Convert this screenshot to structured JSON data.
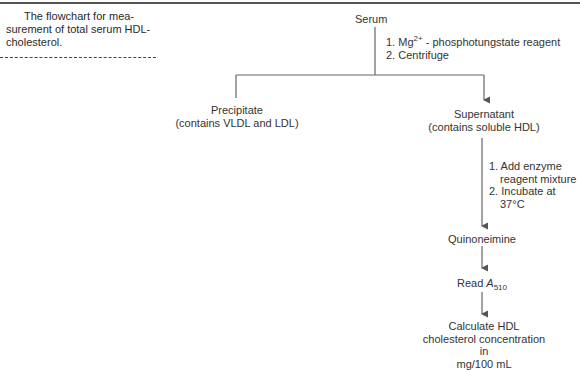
{
  "caption": {
    "line1": "The flowchart for mea-",
    "line2": "surement of total serum HDL-",
    "line3": "cholesterol."
  },
  "nodes": {
    "serum": "Serum",
    "precipitate": {
      "line1": "Precipitate",
      "line2": "(contains VLDL and LDL)"
    },
    "supernatant": {
      "line1": "Supernatant",
      "line2": "(contains soluble HDL)"
    },
    "quinoneimine": "Quinoneimine",
    "read": {
      "prefix": "Read ",
      "var": "A",
      "sub": "510"
    },
    "calculate": {
      "line1": "Calculate HDL",
      "line2": "cholesterol concentration",
      "line3": "in",
      "line4": "mg/100 mL"
    }
  },
  "steps": {
    "step1": {
      "item1_pre": "1. Mg",
      "item1_sup": "2+",
      "item1_post": " - phosphotungstate reagent",
      "item2": "2. Centrifuge"
    },
    "step2": {
      "item1_line1": "1. Add enzyme",
      "item1_line2": "reagent mixture",
      "item2_line1": "2. Incubate at",
      "item2_line2": "37°C"
    }
  },
  "colors": {
    "line": "#555555",
    "text": "#333333"
  }
}
